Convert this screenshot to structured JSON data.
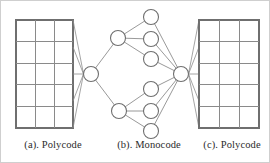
{
  "figure": {
    "width": 270,
    "height": 163,
    "background_color": "#ffffff",
    "border_color": "#cfcfcf",
    "line_color": "#8d8d8d",
    "node_fill_color": "#ffffff",
    "node_stroke_color": "#6f6f6f",
    "grid_line_color": "#8a8a8a",
    "caption_color": "#2b2b2b"
  },
  "captions": {
    "a": "(a). Polycode",
    "b": "(b). Monocode",
    "c": "(c). Polycode"
  },
  "panels": {
    "left_grid": {
      "label": "(a). Polycode",
      "columns": 3,
      "rows": 5,
      "x": 15,
      "y": 19,
      "width": 57,
      "height": 108
    },
    "right_grid": {
      "label": "(c). Polycode",
      "columns": 3,
      "rows": 5,
      "x": 198,
      "y": 19,
      "width": 60,
      "height": 108
    },
    "monocode": {
      "label": "(b). Monocode",
      "node_radius": 7.5,
      "left_hub": {
        "cx": 90,
        "cy": 73
      },
      "right_hub": {
        "cx": 180,
        "cy": 73
      },
      "branch_nodes": [
        {
          "cx": 117,
          "cy": 37
        },
        {
          "cx": 118,
          "cy": 110
        }
      ],
      "leaf_nodes": [
        {
          "cx": 150,
          "cy": 16
        },
        {
          "cx": 150,
          "cy": 38
        },
        {
          "cx": 150,
          "cy": 58
        },
        {
          "cx": 150,
          "cy": 88
        },
        {
          "cx": 150,
          "cy": 110
        },
        {
          "cx": 150,
          "cy": 130
        }
      ]
    }
  },
  "connections": {
    "left_fan_anchor_y": [
      19,
      46,
      73,
      100,
      127
    ],
    "right_fan_anchor_y": [
      19,
      46,
      73,
      100,
      127
    ],
    "tree_edges": [
      "left_hub-branch_top",
      "left_hub-branch_bottom",
      "branch_top-leaf_1",
      "branch_top-leaf_2",
      "branch_top-leaf_3",
      "branch_bottom-leaf_4",
      "branch_bottom-leaf_5",
      "branch_bottom-leaf_6",
      "leaf_1-right_hub",
      "leaf_2-right_hub",
      "leaf_3-right_hub",
      "leaf_4-right_hub",
      "leaf_5-right_hub",
      "leaf_6-right_hub"
    ]
  }
}
